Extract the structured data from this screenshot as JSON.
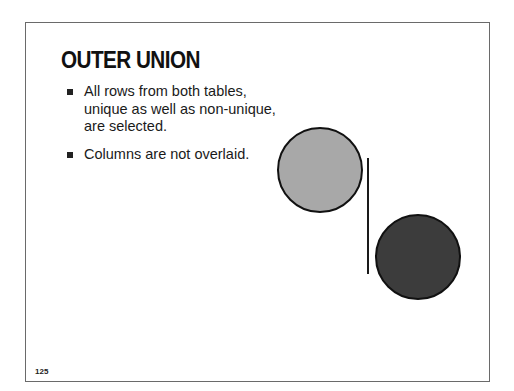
{
  "slide": {
    "title": "OUTER UNION",
    "bullets": [
      {
        "text": "All rows from both tables, unique as well as non-unique, are selected."
      },
      {
        "text": "Columns are not overlaid."
      }
    ],
    "page_number": "125"
  },
  "diagram": {
    "circle_a": {
      "fill": "#a8a8a8",
      "stroke": "#111111"
    },
    "circle_b": {
      "fill": "#3c3c3c",
      "stroke": "#111111"
    },
    "separator_color": "#1a1a1a"
  }
}
